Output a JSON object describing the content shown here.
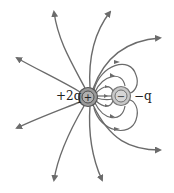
{
  "diagram": {
    "charges": [
      {
        "label": "+2q",
        "sign": "+",
        "cx": 88,
        "cy": 97,
        "r": 9
      },
      {
        "label": "-q",
        "sign": "−",
        "cx": 121,
        "cy": 96,
        "r": 9
      }
    ],
    "labels": {
      "positive": "+2q",
      "negative": "−q"
    },
    "colors": {
      "line": "#6b6b6b",
      "positive_fill": "#9a9a9a",
      "negative_fill": "#c8c8c8",
      "stroke": "#555555"
    },
    "field_lines": {
      "outgoing_to_infinity": 10,
      "positive_to_negative": 8
    }
  }
}
